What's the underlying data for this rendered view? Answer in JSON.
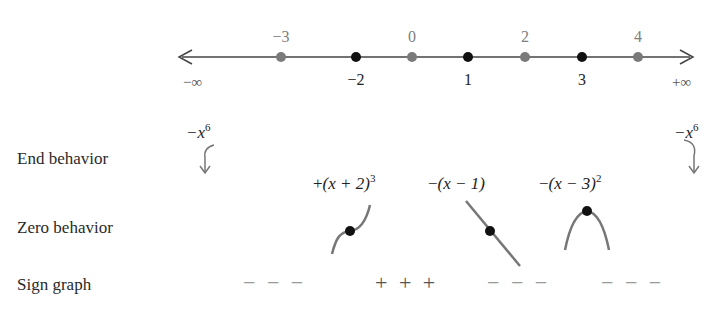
{
  "number_line": {
    "left_label": "−∞",
    "right_label": "+∞",
    "gray_points": [
      {
        "value": "−3",
        "x": 281
      },
      {
        "value": "0",
        "x": 412
      },
      {
        "value": "2",
        "x": 525
      },
      {
        "value": "4",
        "x": 638
      }
    ],
    "black_points": [
      {
        "value": "−2",
        "x": 356
      },
      {
        "value": "1",
        "x": 468
      },
      {
        "value": "3",
        "x": 582
      }
    ],
    "colors": {
      "gray_point": "#7a7a7a",
      "black_point": "#111111",
      "line": "#444444"
    }
  },
  "rows": {
    "end_behavior": "End behavior",
    "zero_behavior": "Zero behavior",
    "sign_graph": "Sign graph"
  },
  "end_behavior": {
    "left_term": "−x",
    "left_exp": "6",
    "right_term": "−x",
    "right_exp": "6"
  },
  "zero_behavior": [
    {
      "sign": "+",
      "factor": "(x + 2)",
      "exp": "3",
      "shape": "cubic-inflection"
    },
    {
      "sign": "−",
      "factor": "(x − 1)",
      "exp": "",
      "shape": "line-decreasing"
    },
    {
      "sign": "−",
      "factor": "(x − 3)",
      "exp": "2",
      "shape": "parabola-down"
    }
  ],
  "sign_graph": [
    "− − −",
    "+ + +",
    "− − −",
    "− − −"
  ]
}
